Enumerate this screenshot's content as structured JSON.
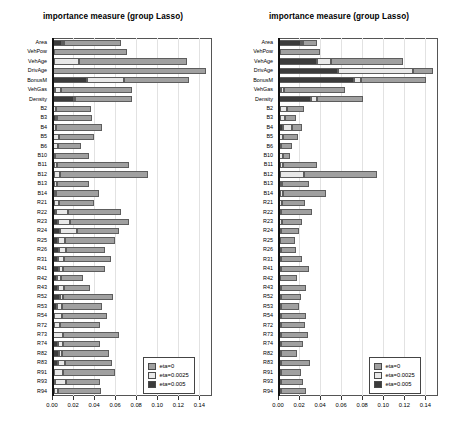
{
  "figure": {
    "width": 452,
    "height": 437,
    "background": "#ffffff"
  },
  "colors": {
    "eta0": "#a0a0a0",
    "eta0025": "#e8e8e8",
    "eta005": "#3b3b3b",
    "grid": "#e2e2e2",
    "axis": "#111111",
    "frame": "#555555"
  },
  "legend": {
    "position": "bottom-right",
    "items": [
      {
        "label": "eta=0",
        "color": "#a0a0a0"
      },
      {
        "label": "eta=0.0025",
        "color": "#e8e8e8"
      },
      {
        "label": "eta=0.005",
        "color": "#3b3b3b"
      }
    ]
  },
  "axis": {
    "xlabel": "",
    "ylabel": "",
    "xticks": [
      0.0,
      0.02,
      0.04,
      0.06,
      0.08,
      0.1,
      0.12,
      0.14
    ],
    "xticklabels": [
      "0.00",
      "0.02",
      "0.04",
      "0.06",
      "0.08",
      "0.10",
      "0.12",
      "0.14"
    ],
    "xlim": [
      0.0,
      0.152
    ],
    "grid": true
  },
  "categories": [
    "Area",
    "VehPow",
    "VehAge",
    "DrivAge",
    "BonusM",
    "VehGas",
    "Density",
    "B2",
    "B3",
    "B4",
    "B5",
    "B6",
    "B10",
    "B11",
    "B12",
    "B13",
    "B14",
    "R21",
    "R22",
    "R23",
    "R24",
    "R25",
    "R26",
    "R31",
    "R41",
    "R42",
    "R43",
    "R52",
    "R53",
    "R54",
    "R72",
    "R73",
    "R74",
    "R82",
    "R83",
    "R91",
    "R93",
    "R94"
  ],
  "chart_data": [
    {
      "type": "bar",
      "orientation": "horizontal",
      "stacked": true,
      "panel": "left",
      "title": "importance measure (group Lasso)",
      "xlabel": "",
      "ylabel": "",
      "xlim": [
        0.0,
        0.152
      ],
      "grid": true,
      "legend_position": "lower right",
      "categories": [
        "Area",
        "VehPow",
        "VehAge",
        "DrivAge",
        "BonusM",
        "VehGas",
        "Density",
        "B2",
        "B3",
        "B4",
        "B5",
        "B6",
        "B10",
        "B11",
        "B12",
        "B13",
        "B14",
        "R21",
        "R22",
        "R23",
        "R24",
        "R25",
        "R26",
        "R31",
        "R41",
        "R42",
        "R43",
        "R52",
        "R53",
        "R54",
        "R72",
        "R73",
        "R74",
        "R82",
        "R83",
        "R91",
        "R93",
        "R94"
      ],
      "series": [
        {
          "name": "eta=0.005",
          "color": "#3b3b3b",
          "values": [
            0.0098,
            0.0012,
            0.0016,
            0.0004,
            0.033,
            0.0027,
            0.0212,
            0.0014,
            0.0036,
            0.001,
            0.0008,
            0.0006,
            0.0012,
            0.0016,
            0.002,
            0.0018,
            0.0016,
            0.0018,
            0.0034,
            0.006,
            0.008,
            0.0058,
            0.0062,
            0.0056,
            0.0066,
            0.0048,
            0.006,
            0.0072,
            0.0052,
            0.0022,
            0.0016,
            0.0012,
            0.0058,
            0.0064,
            0.0056,
            0.0018,
            0.0024,
            0.0018
          ]
        },
        {
          "name": "eta=0.0025",
          "color": "#e8e8e8",
          "values": [
            0.0016,
            0.0006,
            0.024,
            0.0004,
            0.035,
            0.0054,
            0.0008,
            0.0022,
            0.0008,
            0.0028,
            0.0062,
            0.0052,
            0.0016,
            0.0028,
            0.006,
            0.003,
            0.0018,
            0.0048,
            0.012,
            0.0108,
            0.0158,
            0.0064,
            0.0068,
            0.0062,
            0.0042,
            0.0034,
            0.0054,
            0.0028,
            0.0046,
            0.0076,
            0.0058,
            0.0094,
            0.005,
            0.0028,
            0.0068,
            0.0086,
            0.011,
            0.0042
          ]
        },
        {
          "name": "eta=0",
          "color": "#a0a0a0",
          "values": [
            0.0542,
            0.0696,
            0.1026,
            0.1456,
            0.0624,
            0.0678,
            0.054,
            0.0336,
            0.0332,
            0.0436,
            0.033,
            0.0214,
            0.0324,
            0.0686,
            0.0828,
            0.0308,
            0.0414,
            0.0334,
            0.05,
            0.0568,
            0.0398,
            0.048,
            0.0372,
            0.0444,
            0.0396,
            0.0216,
            0.0248,
            0.0476,
            0.0374,
            0.0426,
            0.0386,
            0.0528,
            0.0352,
            0.0452,
            0.0442,
            0.0498,
            0.032,
            0.0408
          ]
        }
      ]
    },
    {
      "type": "bar",
      "orientation": "horizontal",
      "stacked": true,
      "panel": "right",
      "title": "importance measure (group Lasso)",
      "xlabel": "",
      "ylabel": "",
      "xlim": [
        0.0,
        0.152
      ],
      "grid": true,
      "legend_position": "lower right",
      "categories": [
        "Area",
        "VehPow",
        "VehAge",
        "DrivAge",
        "BonusM",
        "VehGas",
        "Density",
        "B2",
        "B3",
        "B4",
        "B5",
        "B6",
        "B10",
        "B11",
        "B12",
        "B13",
        "B14",
        "R21",
        "R22",
        "R23",
        "R24",
        "R25",
        "R26",
        "R31",
        "R41",
        "R42",
        "R43",
        "R52",
        "R53",
        "R54",
        "R72",
        "R73",
        "R74",
        "R82",
        "R83",
        "R91",
        "R93",
        "R94"
      ],
      "series": [
        {
          "name": "eta=0.005",
          "color": "#3b3b3b",
          "values": [
            0.0222,
            0.0014,
            0.0368,
            0.0566,
            0.0724,
            0.003,
            0.031,
            0.0016,
            0.0018,
            0.005,
            0.0014,
            0.001,
            0.0014,
            0.0018,
            0.0022,
            0.0018,
            0.002,
            0.0012,
            0.001,
            0.0012,
            0.001,
            0.0008,
            0.001,
            0.001,
            0.0012,
            0.0008,
            0.001,
            0.001,
            0.001,
            0.001,
            0.001,
            0.001,
            0.001,
            0.001,
            0.001,
            0.001,
            0.001,
            0.001
          ]
        },
        {
          "name": "eta=0.0025",
          "color": "#e8e8e8",
          "values": [
            0.002,
            0.0008,
            0.0134,
            0.0712,
            0.0068,
            0.003,
            0.0058,
            0.0072,
            0.0048,
            0.0082,
            0.0036,
            0.002,
            0.0034,
            0.0032,
            0.0226,
            0.0024,
            0.003,
            0.003,
            0.002,
            0.0022,
            0.0016,
            0.0014,
            0.0016,
            0.0016,
            0.0016,
            0.0014,
            0.0016,
            0.0016,
            0.0016,
            0.0016,
            0.0016,
            0.0016,
            0.0016,
            0.0016,
            0.0016,
            0.0016,
            0.0016,
            0.0016
          ]
        },
        {
          "name": "eta=0",
          "color": "#a0a0a0",
          "values": [
            0.0132,
            0.0378,
            0.0686,
            0.0192,
            0.0616,
            0.058,
            0.0442,
            0.0158,
            0.0104,
            0.0096,
            0.014,
            0.0102,
            0.0068,
            0.0318,
            0.0696,
            0.025,
            0.0406,
            0.0218,
            0.0294,
            0.0192,
            0.017,
            0.0144,
            0.0148,
            0.0204,
            0.0266,
            0.016,
            0.0238,
            0.019,
            0.0178,
            0.0242,
            0.023,
            0.0262,
            0.0208,
            0.0152,
            0.0276,
            0.0196,
            0.0214,
            0.024
          ]
        }
      ]
    }
  ]
}
